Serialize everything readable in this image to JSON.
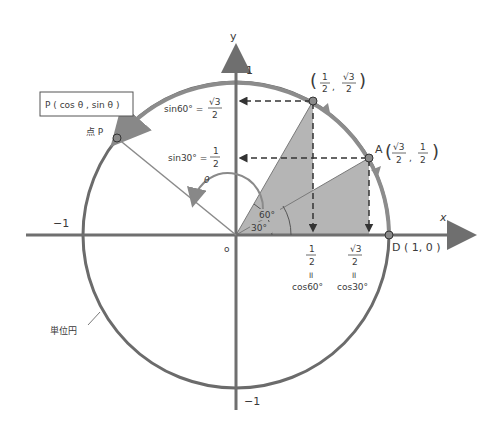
{
  "axes": {
    "x_label": "x",
    "y_label": "y",
    "origin_label": "o",
    "tick_pos_y": "1",
    "tick_neg_y": "−1",
    "tick_neg_x": "−1"
  },
  "points": {
    "p60": {
      "open": "(",
      "xnum": "1",
      "xden": "2",
      "sep": ",",
      "ynum": "√3",
      "yden": "2",
      "close": ")"
    },
    "A": {
      "name": "A",
      "open": "(",
      "xnum": "√3",
      "xden": "2",
      "sep": ",",
      "ynum": "1",
      "yden": "2",
      "close": ")"
    },
    "D": {
      "text": "D ( 1,  0 )"
    },
    "P": {
      "name": "点 P",
      "box_text": "P ( cos θ ,  sin θ )"
    }
  },
  "sin_labels": {
    "sin60": {
      "lhs": "sin60° =",
      "num": "√3",
      "den": "2"
    },
    "sin30": {
      "lhs": "sin30° =",
      "num": "1",
      "den": "2"
    }
  },
  "cos_labels": {
    "cos60": {
      "num": "1",
      "den": "2",
      "eq": "॥",
      "rhs": "cos60°"
    },
    "cos30": {
      "num": "√3",
      "den": "2",
      "eq": "॥",
      "rhs": "cos30°"
    }
  },
  "angles": {
    "theta": "θ",
    "a60": "60°",
    "a30": "30°"
  },
  "unit_circle_label": "単位円",
  "colors": {
    "circle": "#6b6b6b",
    "axis": "#6f6f6f",
    "shade": "#b3b3b3",
    "dash": "#333333",
    "point_fill": "#8a8a8a"
  }
}
